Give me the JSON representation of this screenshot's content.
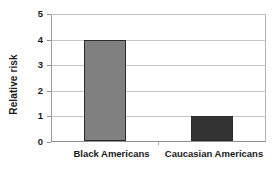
{
  "chart_data": {
    "type": "bar",
    "title": "",
    "subtitle": "",
    "xlabel": "",
    "ylabel": "Relative risk",
    "categories": [
      "Black Americans",
      "Caucasian Americans"
    ],
    "values": [
      4,
      1
    ],
    "series": [
      {
        "name": "Relative risk",
        "values": [
          4,
          1
        ]
      }
    ],
    "ylim": [
      0,
      5
    ],
    "ytick_labels": [
      "0",
      "1",
      "2",
      "3",
      "4",
      "5"
    ],
    "ytick_values": [
      0,
      1,
      2,
      3,
      4,
      5
    ],
    "grid": true,
    "grid_axis": "y",
    "legend": false,
    "legend_position": "none",
    "bar_colors": [
      "#808080",
      "#333333"
    ],
    "bar_border_color": "#2b2b2b",
    "gridline_color": "#c6c6c6",
    "axis_color": "#8e8e8e",
    "text_color": "#1a1a1a",
    "background_color": "#ffffff",
    "annotations": []
  }
}
